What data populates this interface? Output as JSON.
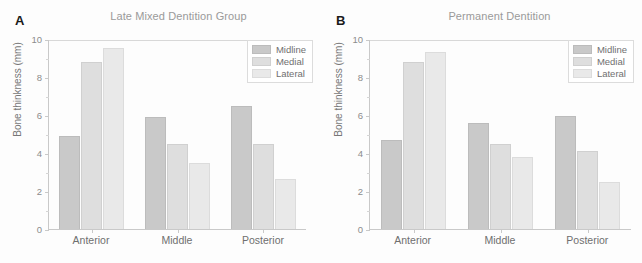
{
  "figure": {
    "width": 642,
    "height": 263,
    "background": "#fdfdfd"
  },
  "panels": [
    {
      "letter": "A",
      "title": "Late Mixed Dentition Group"
    },
    {
      "letter": "B",
      "title": "Permanent Dentition"
    }
  ],
  "axis": {
    "ylabel": "Bone thinkness (mm)",
    "yticks": [
      "0",
      "2",
      "4",
      "6",
      "8",
      "10"
    ],
    "ytick_values": [
      0,
      2,
      4,
      6,
      8,
      10
    ],
    "ymin": 0,
    "ymax": 10
  },
  "legend": {
    "entries": [
      {
        "label": "Midline",
        "color": "#c9c9c9"
      },
      {
        "label": "Medial",
        "color": "#dedede"
      },
      {
        "label": "Lateral",
        "color": "#e9e9e9"
      }
    ]
  },
  "colors": {
    "midline": "#c9c9c9",
    "medial": "#dedede",
    "lateral": "#e9e9e9",
    "axis": "#c9c9c9",
    "title_text": "#9a9a9a",
    "tick_text": "#8c8c8c",
    "label_text": "#6f6f6f"
  },
  "chart_data": [
    {
      "type": "bar",
      "title": "Late Mixed Dentition Group",
      "panel": "A",
      "xlabel": "",
      "ylabel": "Bone thinkness (mm)",
      "ylim": [
        0,
        10
      ],
      "yticks": [
        0,
        2,
        4,
        6,
        8,
        10
      ],
      "grid": false,
      "legend_position": "top-right",
      "categories": [
        "Anterior",
        "Middle",
        "Posterior"
      ],
      "series": [
        {
          "name": "Midline",
          "color": "#c9c9c9",
          "values": [
            4.9,
            5.9,
            6.45
          ]
        },
        {
          "name": "Medial",
          "color": "#dedede",
          "values": [
            8.8,
            4.5,
            4.5
          ]
        },
        {
          "name": "Lateral",
          "color": "#e9e9e9",
          "values": [
            9.55,
            3.45,
            2.65
          ]
        }
      ]
    },
    {
      "type": "bar",
      "title": "Permanent Dentition",
      "panel": "B",
      "xlabel": "",
      "ylabel": "Bone thinkness (mm)",
      "ylim": [
        0,
        10
      ],
      "yticks": [
        0,
        2,
        4,
        6,
        8,
        10
      ],
      "grid": false,
      "legend_position": "top-right",
      "categories": [
        "Anterior",
        "Middle",
        "Posterior"
      ],
      "series": [
        {
          "name": "Midline",
          "color": "#c9c9c9",
          "values": [
            4.7,
            5.6,
            5.95
          ]
        },
        {
          "name": "Medial",
          "color": "#dedede",
          "values": [
            8.8,
            4.5,
            4.1
          ]
        },
        {
          "name": "Lateral",
          "color": "#e9e9e9",
          "values": [
            9.3,
            3.8,
            2.5
          ]
        }
      ]
    }
  ]
}
